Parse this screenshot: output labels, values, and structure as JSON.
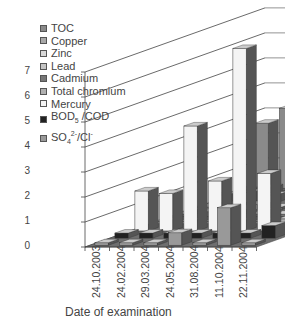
{
  "chart_data": {
    "type": "bar",
    "subtype": "3d-grouped-bar",
    "title": "",
    "xlabel": "Date of examination",
    "ylabel": "",
    "ylim": [
      0,
      7
    ],
    "yticks": [
      "0",
      "1",
      "2",
      "3",
      "4",
      "5",
      "6",
      "7"
    ],
    "grid": true,
    "legend_position": "top-left",
    "categories": [
      "24.10.2003",
      "24.02.2004",
      "29.03.2004",
      "24.05.2004",
      "31.08.2004",
      "11.10.2004",
      "22.11.2004"
    ],
    "series": [
      {
        "name": "TOC",
        "values": [
          2.6,
          3.2,
          2.9,
          3.5,
          4.2,
          3.8,
          2.6
        ]
      },
      {
        "name": "Copper",
        "values": [
          0.2,
          0.3,
          0.2,
          0.3,
          0.3,
          0.4,
          0.3
        ]
      },
      {
        "name": "Zinc",
        "values": [
          0.3,
          0.4,
          0.3,
          0.3,
          0.2,
          0.6,
          0.2
        ]
      },
      {
        "name": "Lead",
        "values": [
          0.1,
          0.1,
          0.2,
          0.1,
          0.1,
          0.1,
          0.1
        ]
      },
      {
        "name": "Cadmium",
        "values": [
          0.1,
          0.2,
          0.1,
          0.1,
          0.1,
          0.1,
          0.1
        ]
      },
      {
        "name": "Total chromium",
        "values": [
          0.1,
          0.1,
          0.1,
          0.1,
          0.1,
          0.2,
          0.1
        ]
      },
      {
        "name": "Mercury",
        "values": [
          1.6,
          1.5,
          4.2,
          2.0,
          7.3,
          2.3,
          0.1
        ]
      },
      {
        "name": "BOD5/COD",
        "values": [
          0.2,
          0.2,
          0.2,
          0.2,
          0.2,
          0.2,
          0.5
        ]
      },
      {
        "name": "SO4 2-/Cl-",
        "values": [
          0.1,
          0.1,
          0.1,
          0.5,
          0.1,
          1.5,
          0.1
        ]
      }
    ]
  },
  "legend": [
    {
      "label": "TOC",
      "fill": "#8a8a8a"
    },
    {
      "label": "Copper",
      "fill": "#a8a8a8"
    },
    {
      "label": "Zinc",
      "fill": "#d8d8d8"
    },
    {
      "label": "Lead",
      "fill": "#c4c4c4"
    },
    {
      "label": "Cadmium",
      "fill": "#777777"
    },
    {
      "label": "Total chromium",
      "fill": "#b0b0b0"
    },
    {
      "label": "Mercury",
      "fill": "#f4f4f4"
    },
    {
      "label": "BOD5 /COD",
      "fill": "#222222"
    },
    {
      "label": "SO42-/Cl-",
      "fill": "#999999"
    }
  ],
  "axis": {
    "y_labels": [
      "0",
      "1",
      "2",
      "3",
      "4",
      "5",
      "6",
      "7"
    ],
    "x_title": "Date of examination"
  }
}
